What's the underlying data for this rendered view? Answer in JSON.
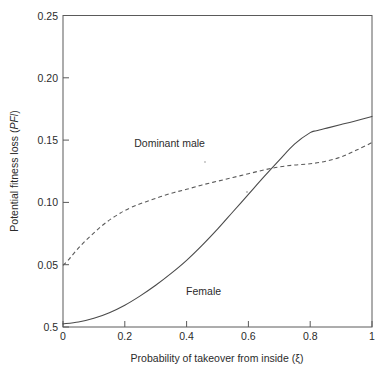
{
  "chart_data": {
    "type": "line",
    "title": "",
    "subtitle": "",
    "xlabel": "Probability of takeover from inside (ξ)",
    "ylabel_prefix": "Potential fitness loss (",
    "ylabel_em": "PFl",
    "ylabel_suffix": ")",
    "ylabel_full": "Potential fitness loss (PFl)",
    "xlim": [
      0,
      1
    ],
    "ylim": [
      0,
      0.25
    ],
    "grid": false,
    "legend_position": "inline-annotations",
    "xticks": [
      0,
      0.2,
      0.4,
      0.6,
      0.8,
      1
    ],
    "xticklabels": [
      "0",
      "0.2",
      "0.4",
      "0.6",
      "0.8",
      "1"
    ],
    "yticks": [
      0,
      0.05,
      0.1,
      0.15,
      0.2,
      0.25
    ],
    "yticklabels": [
      "0.5",
      "0.05",
      "0.10",
      "0.15",
      "0.20",
      "0.25"
    ],
    "series": [
      {
        "name": "Dominant male",
        "style": "dashed",
        "color": "#5a5a5a",
        "label_x": 0.345,
        "label_y": 0.1445,
        "x": [
          0.0,
          0.02,
          0.04,
          0.06,
          0.08,
          0.1,
          0.12,
          0.14,
          0.16,
          0.18,
          0.2,
          0.24,
          0.28,
          0.32,
          0.36,
          0.4,
          0.45,
          0.5,
          0.55,
          0.6,
          0.65,
          0.7,
          0.75,
          0.8,
          0.85,
          0.9,
          0.95,
          1.0
        ],
        "y": [
          0.0495,
          0.0545,
          0.0605,
          0.066,
          0.071,
          0.0755,
          0.08,
          0.084,
          0.0875,
          0.0905,
          0.0935,
          0.098,
          0.1015,
          0.105,
          0.108,
          0.1105,
          0.114,
          0.117,
          0.12,
          0.123,
          0.126,
          0.1285,
          0.13,
          0.131,
          0.133,
          0.1365,
          0.142,
          0.148
        ]
      },
      {
        "name": "Female",
        "style": "solid",
        "color": "#4a4a4a",
        "label_x": 0.455,
        "label_y": 0.0255,
        "x": [
          0.0,
          0.05,
          0.1,
          0.15,
          0.2,
          0.25,
          0.3,
          0.35,
          0.4,
          0.45,
          0.5,
          0.55,
          0.6,
          0.65,
          0.7,
          0.75,
          0.8,
          0.82,
          0.86,
          0.9,
          0.94,
          1.0
        ],
        "y": [
          0.0025,
          0.004,
          0.007,
          0.0115,
          0.0175,
          0.025,
          0.0335,
          0.043,
          0.0535,
          0.0655,
          0.0785,
          0.0925,
          0.1065,
          0.1205,
          0.134,
          0.147,
          0.156,
          0.1575,
          0.16,
          0.1625,
          0.165,
          0.169
        ]
      }
    ],
    "annotations": [
      {
        "text": "Dominant male",
        "x": 0.345,
        "y": 0.1445
      },
      {
        "text": "Female",
        "x": 0.455,
        "y": 0.0255
      }
    ]
  }
}
